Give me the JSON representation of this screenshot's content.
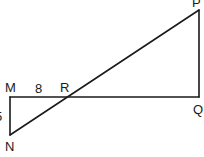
{
  "diagram": {
    "type": "geometry-similar-triangles",
    "points": {
      "P": {
        "label": "P",
        "x": 199,
        "y": 10
      },
      "Q": {
        "label": "Q",
        "x": 199,
        "y": 97
      },
      "M": {
        "label": "M",
        "x": 10,
        "y": 97
      },
      "R": {
        "label": "R",
        "x": 67,
        "y": 97
      },
      "N": {
        "label": "N",
        "x": 10,
        "y": 135
      }
    },
    "segments": [
      {
        "from": "M",
        "to": "Q"
      },
      {
        "from": "P",
        "to": "Q"
      },
      {
        "from": "P",
        "to": "N"
      },
      {
        "from": "M",
        "to": "N"
      }
    ],
    "measurements": {
      "MR": "8",
      "MN": "5"
    },
    "colors": {
      "stroke": "#1a1a1a",
      "background": "#ffffff"
    }
  }
}
